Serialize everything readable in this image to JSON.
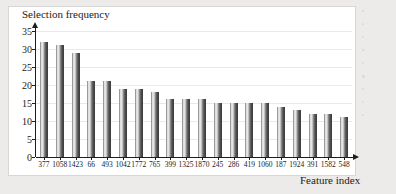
{
  "figure": {
    "background_color": "#edebe9",
    "panel_color": "#ffffff",
    "axis_color": "#1d1d1d",
    "grid_color": "#e9e9e9",
    "bar_light": "#efefef",
    "bar_dark": "#4a4a4a"
  },
  "chart_data": {
    "type": "bar",
    "title": "",
    "ylabel": "Selection frequency",
    "xlabel": "Feature index",
    "ylim": [
      0,
      35
    ],
    "yticks": [
      0,
      5,
      10,
      15,
      20,
      25,
      30,
      35
    ],
    "grid": true,
    "legend": "none",
    "categories": [
      "377",
      "1058",
      "1423",
      "66",
      "493",
      "1042",
      "1772",
      "765",
      "399",
      "1325",
      "1870",
      "245",
      "286",
      "419",
      "1060",
      "187",
      "1924",
      "391",
      "1582",
      "548"
    ],
    "values": [
      32,
      31,
      29,
      21,
      21,
      19,
      19,
      18,
      16,
      16,
      16,
      15,
      15,
      15,
      15,
      14,
      13,
      12,
      12,
      11
    ]
  },
  "side_column": {
    "lines": [
      "s",
      "e",
      "t",
      "a",
      "r",
      "g",
      "c",
      "i",
      "e"
    ]
  }
}
